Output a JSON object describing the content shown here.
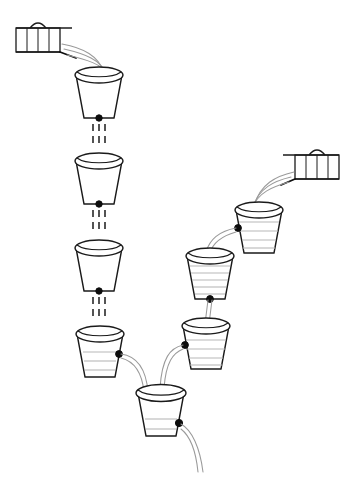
{
  "scene": {
    "title": "Cascading buckets and taps line diagram",
    "canvas_width": 355,
    "canvas_height": 482,
    "background_color": "#ffffff",
    "outline_color": "#1a1a1a",
    "stream_color": "#9a9a9a",
    "water_line_color": "#b8b8b8",
    "spout_dot_color": "#0d0d0d"
  },
  "taps": [
    {
      "id": "tap-top-left",
      "label": "top-left tap",
      "x": 16,
      "y": 26,
      "width": 48,
      "height": 24,
      "facing": "right",
      "slat_count": 4,
      "flowing": true
    },
    {
      "id": "tap-right",
      "label": "right tap",
      "x": 291,
      "y": 144,
      "width": 48,
      "height": 24,
      "facing": "left",
      "slat_count": 4,
      "flowing": true
    }
  ],
  "buckets": [
    {
      "id": "bucket-1",
      "label": "bucket 1 top left",
      "cx": 99,
      "top_y": 70,
      "top_rx": 25,
      "bottom_rx": 17,
      "height": 48,
      "fill_level": 0,
      "water_line_count": 0,
      "spout": "bottom",
      "outflow": "drip"
    },
    {
      "id": "bucket-2",
      "label": "bucket 2 left",
      "cx": 99,
      "top_y": 155,
      "top_rx": 25,
      "bottom_rx": 17,
      "height": 48,
      "fill_level": 0,
      "water_line_count": 0,
      "spout": "bottom",
      "outflow": "drip"
    },
    {
      "id": "bucket-3",
      "label": "bucket 3 left",
      "cx": 99,
      "top_y": 242,
      "top_rx": 25,
      "bottom_rx": 17,
      "height": 48,
      "fill_level": 0,
      "water_line_count": 0,
      "spout": "bottom",
      "outflow": "drip"
    },
    {
      "id": "bucket-4",
      "label": "bucket 4 lower left",
      "cx": 100,
      "top_y": 328,
      "top_rx": 25,
      "bottom_rx": 17,
      "height": 48,
      "fill_level": 0.5,
      "water_line_count": 3,
      "spout": "right",
      "outflow": "stream"
    },
    {
      "id": "bucket-5",
      "label": "bucket 5 bottom center",
      "cx": 161,
      "top_y": 387,
      "top_rx": 25,
      "bottom_rx": 17,
      "height": 48,
      "fill_level": 0.3,
      "water_line_count": 2,
      "spout": "right",
      "outflow": "stream"
    },
    {
      "id": "bucket-6",
      "label": "bucket 6 top right",
      "cx": 259,
      "top_y": 204,
      "top_rx": 25,
      "bottom_rx": 17,
      "height": 48,
      "fill_level": 0.8,
      "water_line_count": 4,
      "spout": "left",
      "outflow": "stream"
    },
    {
      "id": "bucket-7",
      "label": "bucket 7 middle right",
      "cx": 210,
      "top_y": 250,
      "top_rx": 25,
      "bottom_rx": 17,
      "height": 48,
      "fill_level": 0.85,
      "water_line_count": 5,
      "spout": "bottom",
      "outflow": "stream"
    },
    {
      "id": "bucket-8",
      "label": "bucket 8 lower right",
      "cx": 206,
      "top_y": 320,
      "top_rx": 25,
      "bottom_rx": 17,
      "height": 48,
      "fill_level": 0.7,
      "water_line_count": 4,
      "spout": "left",
      "outflow": "stream"
    }
  ],
  "flows": [
    {
      "id": "flow-tap-left-to-b1",
      "from": "tap-top-left",
      "to": "bucket-1",
      "kind": "pour-stream"
    },
    {
      "id": "flow-b1-to-b2",
      "from": "bucket-1",
      "to": "bucket-2",
      "kind": "drip"
    },
    {
      "id": "flow-b2-to-b3",
      "from": "bucket-2",
      "to": "bucket-3",
      "kind": "drip"
    },
    {
      "id": "flow-b3-to-b4",
      "from": "bucket-3",
      "to": "bucket-4",
      "kind": "drip"
    },
    {
      "id": "flow-b4-to-b5",
      "from": "bucket-4",
      "to": "bucket-5",
      "kind": "arc-stream"
    },
    {
      "id": "flow-tap-right-to-b6",
      "from": "tap-right",
      "to": "bucket-6",
      "kind": "pour-stream"
    },
    {
      "id": "flow-b6-to-b7",
      "from": "bucket-6",
      "to": "bucket-7",
      "kind": "arc-stream"
    },
    {
      "id": "flow-b7-to-b8",
      "from": "bucket-7",
      "to": "bucket-8",
      "kind": "vertical-stream"
    },
    {
      "id": "flow-b8-to-b5",
      "from": "bucket-8",
      "to": "bucket-5",
      "kind": "arc-stream"
    },
    {
      "id": "flow-b5-outlet",
      "from": "bucket-5",
      "to": "outside",
      "kind": "arc-stream"
    }
  ]
}
